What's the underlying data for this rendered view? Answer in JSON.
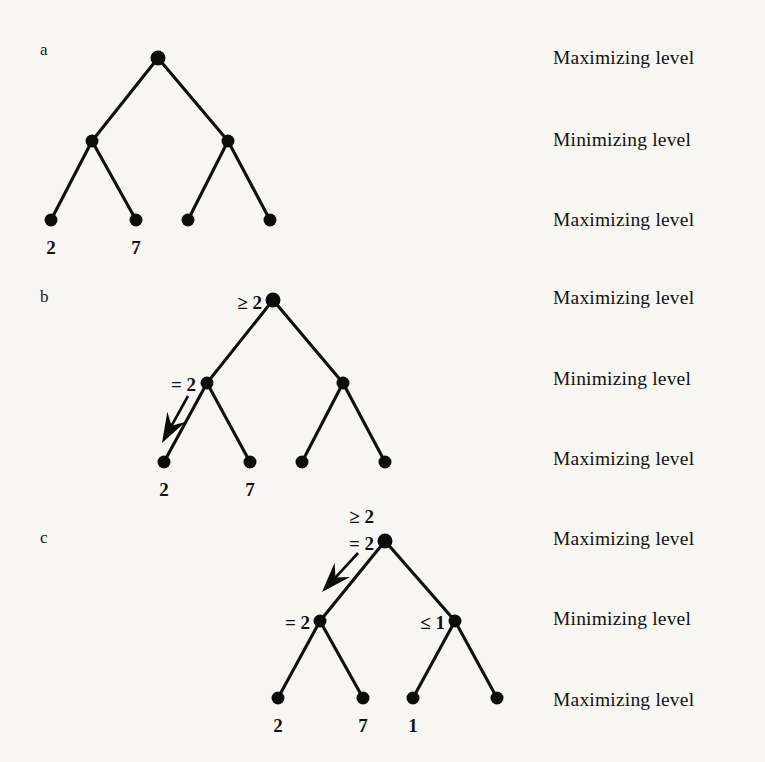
{
  "figure": {
    "background_color": "#f7f6f3",
    "ink_color": "#0c0c0c",
    "panels": [
      {
        "letter": "a",
        "letter_pos": {
          "x": 40,
          "y": 41
        },
        "levels": [
          {
            "label": "Maximizing level",
            "y": 48
          },
          {
            "label": "Minimizing level",
            "y": 130
          },
          {
            "label": "Maximizing level",
            "y": 210
          }
        ],
        "nodes": [
          {
            "id": "a-root",
            "x": 158,
            "y": 58,
            "r": 7.5
          },
          {
            "id": "a-min-l",
            "x": 92,
            "y": 141,
            "r": 6.5
          },
          {
            "id": "a-min-r",
            "x": 228,
            "y": 141,
            "r": 6.5
          },
          {
            "id": "a-leaf-1",
            "x": 51,
            "y": 220,
            "r": 6.5
          },
          {
            "id": "a-leaf-2",
            "x": 136,
            "y": 220,
            "r": 6.5
          },
          {
            "id": "a-leaf-3",
            "x": 188,
            "y": 220,
            "r": 6.5
          },
          {
            "id": "a-leaf-4",
            "x": 270,
            "y": 220,
            "r": 6.5
          }
        ],
        "edges": [
          {
            "from": "a-root",
            "to": "a-min-l"
          },
          {
            "from": "a-root",
            "to": "a-min-r"
          },
          {
            "from": "a-min-l",
            "to": "a-leaf-1"
          },
          {
            "from": "a-min-l",
            "to": "a-leaf-2"
          },
          {
            "from": "a-min-r",
            "to": "a-leaf-3"
          },
          {
            "from": "a-min-r",
            "to": "a-leaf-4"
          }
        ],
        "leaf_values": [
          {
            "text": "2",
            "x": 51,
            "y": 238
          },
          {
            "text": "7",
            "x": 136,
            "y": 238
          }
        ],
        "annotations": [],
        "arrows": []
      },
      {
        "letter": "b",
        "letter_pos": {
          "x": 40,
          "y": 288
        },
        "levels": [
          {
            "label": "Maximizing level",
            "y": 288
          },
          {
            "label": "Minimizing level",
            "y": 369
          },
          {
            "label": "Maximizing level",
            "y": 449
          }
        ],
        "nodes": [
          {
            "id": "b-root",
            "x": 273,
            "y": 300,
            "r": 7.5
          },
          {
            "id": "b-min-l",
            "x": 207,
            "y": 383,
            "r": 6.5
          },
          {
            "id": "b-min-r",
            "x": 343,
            "y": 383,
            "r": 6.5
          },
          {
            "id": "b-leaf-1",
            "x": 164,
            "y": 462,
            "r": 6.5
          },
          {
            "id": "b-leaf-2",
            "x": 250,
            "y": 462,
            "r": 6.5
          },
          {
            "id": "b-leaf-3",
            "x": 302,
            "y": 462,
            "r": 6.5
          },
          {
            "id": "b-leaf-4",
            "x": 385,
            "y": 462,
            "r": 6.5
          }
        ],
        "edges": [
          {
            "from": "b-root",
            "to": "b-min-l"
          },
          {
            "from": "b-root",
            "to": "b-min-r"
          },
          {
            "from": "b-min-l",
            "to": "b-leaf-1"
          },
          {
            "from": "b-min-l",
            "to": "b-leaf-2"
          },
          {
            "from": "b-min-r",
            "to": "b-leaf-3"
          },
          {
            "from": "b-min-r",
            "to": "b-leaf-4"
          }
        ],
        "leaf_values": [
          {
            "text": "2",
            "x": 164,
            "y": 480
          },
          {
            "text": "7",
            "x": 250,
            "y": 480
          }
        ],
        "annotations": [
          {
            "text": "≥ 2",
            "x": 262,
            "y": 293,
            "anchor": "right"
          },
          {
            "text": "= 2",
            "x": 196,
            "y": 375,
            "anchor": "right"
          }
        ],
        "arrows": [
          {
            "x1": 188,
            "y1": 396,
            "x2": 162,
            "y2": 443
          }
        ]
      },
      {
        "letter": "c",
        "letter_pos": {
          "x": 40,
          "y": 529
        },
        "levels": [
          {
            "label": "Maximizing level",
            "y": 529
          },
          {
            "label": "Minimizing level",
            "y": 609
          },
          {
            "label": "Maximizing level",
            "y": 690
          }
        ],
        "nodes": [
          {
            "id": "c-root",
            "x": 385,
            "y": 541,
            "r": 7.5
          },
          {
            "id": "c-min-l",
            "x": 320,
            "y": 621,
            "r": 6.5
          },
          {
            "id": "c-min-r",
            "x": 455,
            "y": 621,
            "r": 6.5
          },
          {
            "id": "c-leaf-1",
            "x": 278,
            "y": 698,
            "r": 6.5
          },
          {
            "id": "c-leaf-2",
            "x": 363,
            "y": 698,
            "r": 6.5
          },
          {
            "id": "c-leaf-3",
            "x": 413,
            "y": 698,
            "r": 6.5
          },
          {
            "id": "c-leaf-4",
            "x": 497,
            "y": 698,
            "r": 6.5
          }
        ],
        "edges": [
          {
            "from": "c-root",
            "to": "c-min-l"
          },
          {
            "from": "c-root",
            "to": "c-min-r"
          },
          {
            "from": "c-min-l",
            "to": "c-leaf-1"
          },
          {
            "from": "c-min-l",
            "to": "c-leaf-2"
          },
          {
            "from": "c-min-r",
            "to": "c-leaf-3"
          },
          {
            "from": "c-min-r",
            "to": "c-leaf-4"
          }
        ],
        "leaf_values": [
          {
            "text": "2",
            "x": 278,
            "y": 716
          },
          {
            "text": "7",
            "x": 363,
            "y": 716
          },
          {
            "text": "1",
            "x": 413,
            "y": 716
          }
        ],
        "annotations": [
          {
            "text": "≥ 2",
            "x": 374,
            "y": 507,
            "anchor": "right"
          },
          {
            "text": "= 2",
            "x": 374,
            "y": 534,
            "anchor": "right"
          },
          {
            "text": "= 2",
            "x": 310,
            "y": 613,
            "anchor": "right"
          },
          {
            "text": "≤ 1",
            "x": 445,
            "y": 613,
            "anchor": "right"
          }
        ],
        "arrows": [
          {
            "x1": 358,
            "y1": 553,
            "x2": 322,
            "y2": 592
          }
        ]
      }
    ],
    "level_label_x": 553
  }
}
